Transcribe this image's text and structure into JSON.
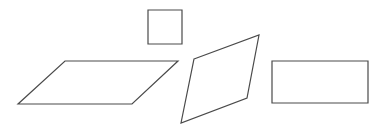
{
  "figure": {
    "width": 383,
    "height": 131,
    "background": "#ffffff",
    "stroke_color": "#4a4a4a",
    "stroke_width": 1.2
  },
  "shapes": [
    {
      "name": "square",
      "type": "polygon",
      "points": "148,10 182,10 182,44 148,44"
    },
    {
      "name": "parallelogram",
      "type": "polygon",
      "points": "65,61 178,61 132,104 18,104"
    },
    {
      "name": "rhombus",
      "type": "polygon",
      "points": "194,59 259,35 247,98 181,123"
    },
    {
      "name": "rectangle",
      "type": "polygon",
      "points": "272,61 368,61 368,103 272,103"
    }
  ]
}
